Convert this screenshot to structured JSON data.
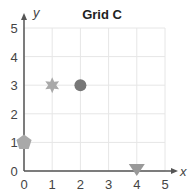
{
  "chart_data": {
    "type": "scatter",
    "title": "Grid C",
    "xlabel": "x",
    "ylabel": "y",
    "xlim": [
      0,
      5
    ],
    "ylim": [
      0,
      5
    ],
    "grid": true,
    "x_ticks": [
      "0",
      "1",
      "2",
      "3",
      "4",
      "5"
    ],
    "y_ticks": [
      "0",
      "1",
      "2",
      "3",
      "4",
      "5"
    ],
    "points": [
      {
        "shape": "pentagon",
        "x": 0,
        "y": 1,
        "color": "#a9a9a9"
      },
      {
        "shape": "star",
        "x": 1,
        "y": 3,
        "color": "#a9a9a9"
      },
      {
        "shape": "circle",
        "x": 2,
        "y": 3,
        "color": "#777777"
      },
      {
        "shape": "triangle-down",
        "x": 4,
        "y": 0,
        "color": "#999999"
      }
    ]
  },
  "colors": {
    "axis": "#555555",
    "grid": "#e6e6e6"
  }
}
